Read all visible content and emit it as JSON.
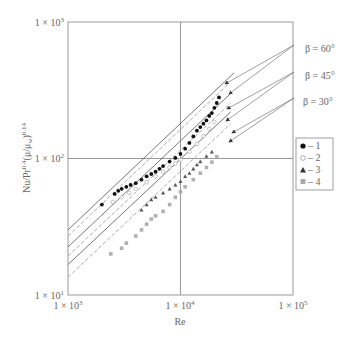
{
  "chart_data": {
    "type": "scatter",
    "title": "",
    "xlabel": "Re",
    "ylabel": "Nu/Pr^0.4 (μ/μ_w)^0.14",
    "xscale": "log",
    "yscale": "log",
    "xlim": [
      1000,
      100000
    ],
    "ylim": [
      10,
      1000
    ],
    "grid": true,
    "x_ticks": [
      "1 × 10^3",
      "1 × 10^4",
      "1 × 10^5"
    ],
    "y_ticks": [
      "1 × 10^3",
      "1 × 10^2",
      "1 × 10^1"
    ],
    "legend_position": "right",
    "legend": [
      {
        "marker": "filled-circle",
        "label": "– 1"
      },
      {
        "marker": "open-circle",
        "label": "– 2"
      },
      {
        "marker": "filled-triangle",
        "label": "– 3"
      },
      {
        "marker": "grey-square",
        "label": "– 4"
      }
    ],
    "annotations": [
      {
        "text": "β = 60°",
        "x_px": 305,
        "y_px": 48
      },
      {
        "text": "β = 45°",
        "x_px": 305,
        "y_px": 75
      },
      {
        "text": "β = 30°",
        "x_px": 303,
        "y_px": 101
      }
    ],
    "lines": [
      {
        "name": "β = 60° (solid)",
        "style": "solid",
        "x": [
          1000,
          30000
        ],
        "y": [
          30,
          425
        ]
      },
      {
        "name": "β = 60° (dashed)",
        "style": "dashed",
        "x": [
          1000,
          27000
        ],
        "y": [
          27,
          355
        ]
      },
      {
        "name": "β = 45° (solid)",
        "style": "solid",
        "x": [
          1000,
          28000
        ],
        "y": [
          22.5,
          300
        ]
      },
      {
        "name": "β = 45° (dashed)",
        "style": "dashed",
        "x": [
          1000,
          28000
        ],
        "y": [
          19.3,
          255
        ]
      },
      {
        "name": "β = 30° (solid)",
        "style": "solid",
        "x": [
          1000,
          28000
        ],
        "y": [
          16.7,
          220
        ]
      },
      {
        "name": "β = 30° (dashed)",
        "style": "dashed",
        "x": [
          1000,
          28000
        ],
        "y": [
          13.5,
          180
        ]
      }
    ],
    "series": [
      {
        "name": "1",
        "marker": "filled-circle",
        "x": [
          2000,
          2600,
          2800,
          3000,
          3300,
          3600,
          4000,
          4500,
          5000,
          5500,
          6000,
          6500,
          7000,
          8000,
          9000,
          10000,
          11000,
          12000,
          13000,
          14000,
          15000,
          16000,
          17000,
          18000,
          19000,
          20000,
          21000,
          22000
        ],
        "y": [
          46,
          55,
          58,
          60,
          62,
          64,
          66,
          70,
          74,
          77,
          80,
          84,
          88,
          95,
          101,
          108,
          118,
          130,
          145,
          160,
          170,
          180,
          190,
          205,
          215,
          235,
          255,
          280
        ]
      },
      {
        "name": "2",
        "marker": "open-circle",
        "x": [
          2500,
          3000,
          3500,
          4000,
          5000,
          6000,
          7000,
          8000,
          9000,
          10000,
          12000,
          14000,
          16000,
          18000,
          20000
        ],
        "y": [
          48,
          52,
          56,
          60,
          67,
          74,
          80,
          86,
          92,
          98,
          112,
          128,
          146,
          165,
          185
        ]
      },
      {
        "name": "3",
        "marker": "filled-triangle",
        "x": [
          4500,
          5000,
          5500,
          6000,
          7000,
          8000,
          9000,
          10000,
          11000,
          12000,
          13000,
          14000,
          15000,
          17000,
          19000
        ],
        "y": [
          42,
          46,
          50,
          52,
          56,
          60,
          64,
          68,
          74,
          78,
          84,
          90,
          95,
          104,
          112
        ]
      },
      {
        "name": "4",
        "marker": "grey-square",
        "x": [
          2400,
          3000,
          3300,
          4000,
          4500,
          5000,
          5500,
          6000,
          7000,
          8000,
          9000,
          10000,
          11000,
          13000,
          15000,
          17000,
          19000,
          21000
        ],
        "y": [
          20,
          22,
          24,
          27,
          30,
          33,
          36,
          38,
          41,
          46,
          52,
          57,
          62,
          70,
          78,
          86,
          94,
          103
        ]
      }
    ]
  }
}
